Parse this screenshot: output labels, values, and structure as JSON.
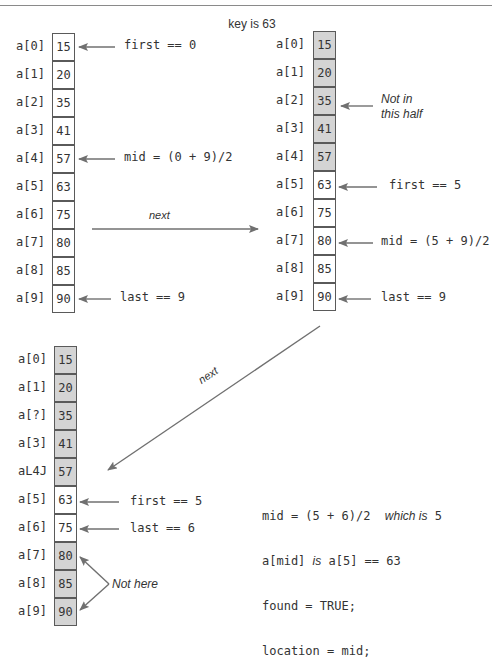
{
  "title": "key is 63",
  "array": {
    "indices": [
      "a[0]",
      "a[1]",
      "a[2]",
      "a[3]",
      "a[4]",
      "a[5]",
      "a[6]",
      "a[7]",
      "a[8]",
      "a[9]"
    ],
    "values": [
      "15",
      "20",
      "35",
      "41",
      "57",
      "63",
      "75",
      "80",
      "85",
      "90"
    ]
  },
  "panel1": {
    "shaded": [
      false,
      false,
      false,
      false,
      false,
      false,
      false,
      false,
      false,
      false
    ],
    "annotations": {
      "first": "first == 0",
      "mid": "mid = (0 + 9)/2",
      "last": "last == 9"
    }
  },
  "transition1": {
    "label": "next"
  },
  "panel2": {
    "shaded": [
      true,
      true,
      true,
      true,
      true,
      false,
      false,
      false,
      false,
      false
    ],
    "annotations": {
      "not_in_line1": "Not in",
      "not_in_line2": "this half",
      "first": "first == 5",
      "mid": "mid = (5 + 9)/2",
      "last": "last == 9"
    }
  },
  "transition2": {
    "label": "next"
  },
  "panel3": {
    "shaded": [
      true,
      true,
      true,
      true,
      true,
      false,
      false,
      true,
      true,
      true
    ],
    "indices_as_printed": [
      "a[0]",
      "a[1]",
      "a[?]",
      "a[3]",
      "aL4J",
      "a[5]",
      "a[6]",
      "a[7]",
      "a[8]",
      "a[9]"
    ],
    "annotations": {
      "first": "first == 5",
      "last": "last == 6",
      "not_here": "Not here"
    },
    "result": {
      "line1_code": "mid = (5 + 6)/2",
      "line1_text": "which is",
      "line1_value": "5",
      "line2_code_a": "a[mid]",
      "line2_text": "is",
      "line2_code_b": "a[5] == 63",
      "line3": "found = TRUE;",
      "line4": "location = mid;"
    }
  },
  "colors": {
    "shaded_fill": "#d4d4d4",
    "border": "#5a5a5a",
    "arrow": "#707070",
    "text": "#333333"
  }
}
